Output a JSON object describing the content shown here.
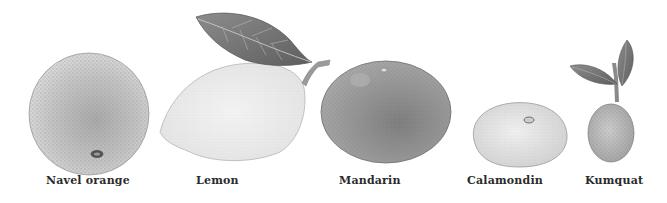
{
  "figure": {
    "style": "grayscale watercolor botanical illustration",
    "background": "#ffffff"
  },
  "fruits": [
    {
      "name": "Navel orange",
      "label_x": 46
    },
    {
      "name": "Lemon",
      "label_x": 196
    },
    {
      "name": "Mandarin",
      "label_x": 339
    },
    {
      "name": "Calamondin",
      "label_x": 467
    },
    {
      "name": "Kumquat",
      "label_x": 585
    }
  ]
}
